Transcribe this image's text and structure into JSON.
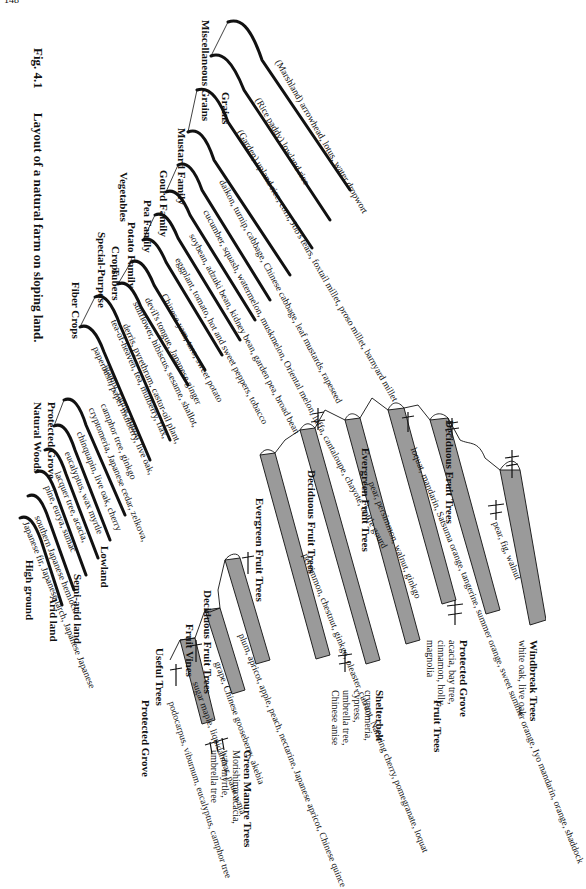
{
  "page_number": "148",
  "figure": {
    "number": "Fig. 4.1",
    "title": "Layout of a natural farm on sloping land."
  },
  "zones": {
    "high_ground": "High ground",
    "arid_land": "Arid land",
    "semi_arid_land": "Semi-arid land",
    "lowland": "Lowland"
  },
  "natural_woods": {
    "heading1": "Natural Woods",
    "heading2": "Protected Grove",
    "rows": [
      "Japanese fir, Japanese larch, Japanese Japanese",
      "southern Japanese hemlock",
      "pine, eurya, sumac",
      "lacquer tree, acacia,",
      "eucalyptus, wax myrtle",
      "chinquapin, live oak, cherry",
      "cryptomeria, Japanese cedar, zelkova,",
      "camphor tree, ginkgo"
    ]
  },
  "fiber_crops": {
    "heading": "Fiber Crops",
    "rows": [
      "paperbush, paper mulberry, live oak,",
      "gampi, ramie, cotton",
      "tea-of-heaven, tea, mulberry, flax,",
      "derris, pyrethrum, castor-oil plant,"
    ]
  },
  "special_purpose_crops": {
    "heading1": "Special-Purpose",
    "heading2": "Crops",
    "rows": [
      "sunflower, hibiscus, sesame, shallot,",
      "devil's tongue, Japanese ginger"
    ]
  },
  "vegetables": {
    "heading": "Vegetables",
    "families": [
      {
        "name": "Tubers",
        "items": "Chinese yam, taro, sweet potato"
      },
      {
        "name": "Potato Family",
        "items": "eggplant, tomato, hot and sweet peppers, tobacco"
      },
      {
        "name": "Pea Family",
        "items": "soybean, adzuki bean, kidney bean, garden pea, broad bean"
      },
      {
        "name": "Gourd Family",
        "items": "cucumber, squash, watermelon, muskmelon, Oriental melon, luffa, cantaloupe, chayote, bottle gourd"
      },
      {
        "name": "Mustard Family",
        "items": "daikon, turnip, cabbage, Chinese cabbage, leaf mustards, rapeseed"
      }
    ]
  },
  "grains": {
    "heading": "Grains",
    "families": [
      {
        "name": "Miscellaneous Grains",
        "items": "(Garden) upland rice, corn, Job's tears, foxtail millet, proso millet, barnyard millet"
      },
      {
        "name": "",
        "items": "(Rice paddy) lowland rice"
      },
      {
        "name": "",
        "items": "(Marshland) arrowhead, lotus, water dropwort"
      }
    ]
  },
  "fruit_trees_section": {
    "label": "Fruit Trees",
    "groups": [
      {
        "name": "Protected Grove",
        "items": "podocarpus, viburnum, eucalyptus, camphor tree"
      },
      {
        "name": "Useful Trees",
        "items": "sugar maple, liquidambar, paulownia"
      },
      {
        "name": "Fruit Vines",
        "items": "grape, Chinese gooseberry, akebia"
      },
      {
        "name": "Deciduous Fruit Trees",
        "items": "plum, apricot, apple, peach, nectarine, Japanese apricot, Chinese quince"
      },
      {
        "name": "Evergreen Fruit Trees",
        "items": "persimmon, chestnut, ginkgo, oleaster, currant, Nanking cherry, pomegranate, loquat"
      },
      {
        "name": "Deciduous Fruit Trees",
        "items": "pear, persimmon, walnut, ginkgo"
      },
      {
        "name": "Evergreen Fruit Trees",
        "items": "loquat, mandarin, Satsuma orange, tangerine, summer orange, sweet summer orange, Iyo mandarin, orange, shaddock"
      },
      {
        "name": "Deciduous Fruit Trees",
        "items": "pear, fig, walnut"
      }
    ]
  },
  "annotations": {
    "green_manure": {
      "heading": "Green Manure Trees",
      "lines": [
        "Morishima acacia,",
        "wax myrtle,",
        "umbrella tree"
      ]
    },
    "shelterbelt": {
      "heading": "Shelterbelt",
      "lines": [
        "cryptomeria,",
        "cypress,",
        "umbrella tree,",
        "Chinese anise"
      ]
    },
    "protected_grove": {
      "heading": "Protected Grove",
      "lines": [
        "acacia, bay tree,",
        "cinnamon, holly,",
        "magnolia"
      ]
    },
    "windbreak": {
      "heading": "Windbreak Trees",
      "lines": [
        "white oak, live oak"
      ]
    }
  }
}
